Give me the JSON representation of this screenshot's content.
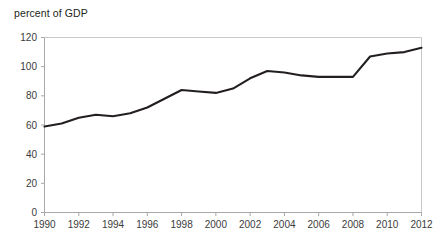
{
  "chart": {
    "axis_title": "percent of GDP"
  },
  "chart_data": {
    "type": "line",
    "title": "percent of GDP",
    "xlabel": "",
    "ylabel": "percent of GDP",
    "xlim": [
      1990,
      2012
    ],
    "ylim": [
      0,
      120
    ],
    "ytick_labels": [
      "0",
      "20",
      "40",
      "60",
      "80",
      "100",
      "120"
    ],
    "yticks": [
      0,
      20,
      40,
      60,
      80,
      100,
      120
    ],
    "xtick_labels": [
      "1990",
      "1992",
      "1994",
      "1996",
      "1998",
      "2000",
      "2002",
      "2004",
      "2006",
      "2008",
      "2010",
      "2012"
    ],
    "xticks": [
      1990,
      1992,
      1994,
      1996,
      1998,
      2000,
      2002,
      2004,
      2006,
      2008,
      2010,
      2012
    ],
    "grid": false,
    "legend": null,
    "line_color": "#231f20",
    "x": [
      1990,
      1991,
      1992,
      1993,
      1994,
      1995,
      1996,
      1997,
      1998,
      1999,
      2000,
      2001,
      2002,
      2003,
      2004,
      2005,
      2006,
      2007,
      2008,
      2009,
      2010,
      2011,
      2012
    ],
    "values": [
      59,
      61,
      65,
      67,
      66,
      68,
      72,
      78,
      84,
      83,
      82,
      85,
      92,
      97,
      96,
      94,
      93,
      93,
      93,
      107,
      109,
      110,
      113
    ],
    "series": [
      {
        "name": "percent of GDP",
        "values": [
          59,
          61,
          65,
          67,
          66,
          68,
          72,
          78,
          84,
          83,
          82,
          85,
          92,
          97,
          96,
          94,
          93,
          93,
          93,
          107,
          109,
          110,
          113
        ]
      }
    ]
  }
}
